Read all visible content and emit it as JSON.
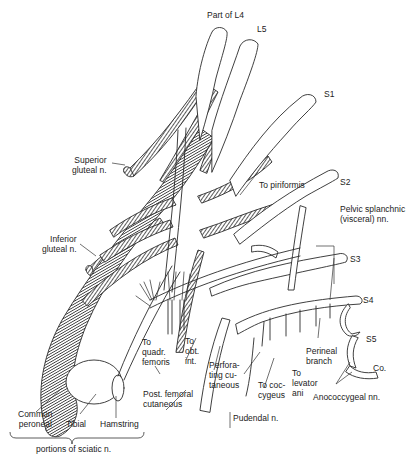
{
  "diagram": {
    "roots": [
      {
        "id": "l4",
        "label": "Part of L4"
      },
      {
        "id": "l5",
        "label": "L5"
      },
      {
        "id": "s1",
        "label": "S1"
      },
      {
        "id": "s2",
        "label": "S2"
      },
      {
        "id": "s3",
        "label": "S3"
      },
      {
        "id": "s4",
        "label": "S4"
      },
      {
        "id": "s5",
        "label": "S5"
      },
      {
        "id": "co",
        "label": "Co."
      }
    ],
    "branches": {
      "superior_gluteal": "Superior\ngluteal n.",
      "inferior_gluteal": "Inferior\ngluteal n.",
      "to_piriformis": "To piriformis",
      "pelvic_splanchnic": "Pelvic splanchnic\n(visceral) nn.",
      "to_quadr_femoris": "To\nquadr.\nfemoris",
      "to_obt_int": "To\nobt.\nint.",
      "perforating_cutaneous": "Perfora-\nting cu-\ntaneous",
      "post_femoral_cutaneous": "Post. femoral\ncutaneous",
      "pudendal": "Pudendal n.",
      "to_coccygeus": "To coc-\ncygeus",
      "to_levator_ani": "To\nlevator\nani",
      "perineal_branch": "Perineal\nbranch",
      "anococcygeal": "Anococcygeal nn."
    },
    "sciatic_portions": {
      "common_peroneal": "Common\nperoneal",
      "tibial": "Tibial",
      "hamstring": "Hamstring",
      "caption": "portions of sciatic n."
    },
    "colors": {
      "line": "#2a2a2a",
      "hatch": "#3a3a3a",
      "background": "#ffffff"
    }
  }
}
